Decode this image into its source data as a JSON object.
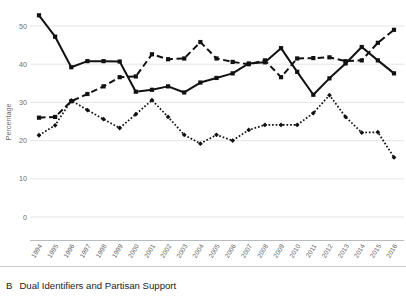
{
  "caption": {
    "letter": "B",
    "text": "Dual Identifiers and Partisan Support"
  },
  "chart_data": {
    "type": "line",
    "title": "",
    "xlabel": "",
    "ylabel": "Percentage",
    "ylim": [
      0,
      55
    ],
    "yticks": [
      0,
      10,
      20,
      30,
      40,
      50
    ],
    "ytick_labels": [
      "0",
      "10",
      "20",
      "30",
      "40",
      "50"
    ],
    "grid": true,
    "legend": "none",
    "x": [
      1994,
      1995,
      1996,
      1997,
      1998,
      1999,
      2000,
      2001,
      2002,
      2003,
      2004,
      2005,
      2006,
      2007,
      2008,
      2009,
      2010,
      2011,
      2012,
      2013,
      2014,
      2015,
      2016
    ],
    "categories": [
      "1994",
      "1995",
      "1996",
      "1997",
      "1998",
      "1999",
      "2000",
      "2001",
      "2002",
      "2003",
      "2004",
      "2005",
      "2006",
      "2007",
      "2008",
      "2009",
      "2010",
      "2011",
      "2012",
      "2013",
      "2014",
      "2015",
      "2016"
    ],
    "series": [
      {
        "name": "series-solid",
        "style": "solid",
        "marker": "square",
        "color": "#111111",
        "values": [
          52.8,
          47.2,
          39.2,
          40.8,
          40.8,
          40.7,
          32.8,
          33.3,
          34.2,
          32.6,
          35.2,
          36.4,
          37.6,
          40.2,
          40.5,
          44.2,
          38.0,
          32.0,
          36.3,
          40.2,
          44.5,
          41.0,
          37.6
        ]
      },
      {
        "name": "series-dashed",
        "style": "dashed",
        "marker": "square",
        "color": "#111111",
        "values": [
          26.0,
          26.2,
          30.3,
          32.2,
          34.2,
          36.6,
          36.8,
          42.6,
          41.3,
          41.5,
          45.8,
          41.5,
          40.6,
          40.0,
          41.0,
          36.6,
          41.5,
          41.6,
          41.8,
          40.8,
          41.0,
          45.6,
          49.0
        ]
      },
      {
        "name": "series-dotted",
        "style": "dotted",
        "marker": "diamond",
        "color": "#111111",
        "values": [
          21.4,
          24.0,
          30.5,
          28.0,
          25.6,
          23.3,
          26.9,
          30.6,
          26.2,
          21.5,
          19.2,
          21.5,
          20.0,
          22.8,
          24.1,
          24.1,
          24.1,
          27.2,
          31.9,
          26.2,
          22.1,
          22.2,
          15.6
        ]
      }
    ]
  }
}
